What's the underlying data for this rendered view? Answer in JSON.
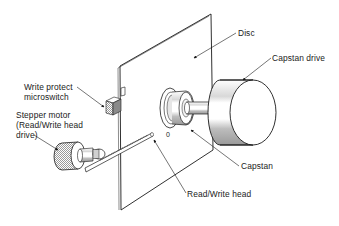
{
  "diagram": {
    "labels": {
      "disc": "Disc",
      "capstan_drive": "Capstan drive",
      "write_protect_line1": "Write protect",
      "write_protect_line2": "microswitch",
      "stepper_line1": "Stepper motor",
      "stepper_line2": "(Read/Write head",
      "stepper_line3": "drive)",
      "capstan": "Capstan",
      "read_write_head": "Read/Write head",
      "hub_mark": "0"
    },
    "colors": {
      "line": "#1a1a1a",
      "shade": "#b8b8b8",
      "background": "#ffffff"
    }
  }
}
